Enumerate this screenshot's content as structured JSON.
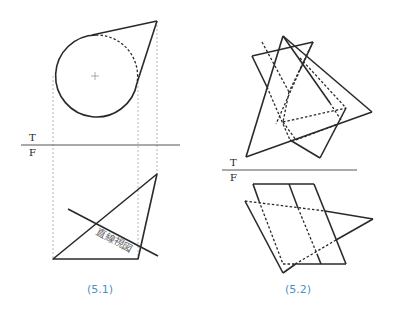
{
  "figures": [
    {
      "id": "5.1",
      "caption": "(5.1)",
      "fold_labels": {
        "top": "T",
        "front": "F"
      },
      "annotation": "直線視図",
      "description": "Cone tangent to circle: top view circle with tangent apex, front view triangle with edge-view line"
    },
    {
      "id": "5.2",
      "caption": "(5.2)",
      "fold_labels": {
        "top": "T",
        "front": "F"
      },
      "description": "Intersecting triangle and parallelogram planes in top and front views with hidden lines"
    }
  ],
  "colors": {
    "line": "#2a2a2a",
    "projector": "#9a9a9a",
    "caption": "#4a90c8",
    "annotation": "#666666"
  }
}
